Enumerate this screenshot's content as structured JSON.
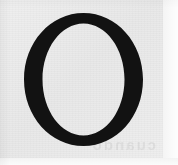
{
  "image": {
    "kind": "scanned-page-fragment",
    "width": 178,
    "height": 165,
    "description": "Scanned fragment of a printed page showing a single large capital letter"
  },
  "paper": {
    "name": "scanned-paper-sheet",
    "background_color": "#ececec",
    "margin_color": "#fafafa",
    "left": 0,
    "top": 0,
    "width": 163,
    "height": 158
  },
  "letter": {
    "character": "O",
    "case": "uppercase",
    "style": "didone-serif",
    "ink_color": "#121212",
    "stroke_contrast": "high",
    "thick_stroke_px": 18,
    "thin_stroke_px": 10,
    "bounds": {
      "x": 24,
      "y": 13,
      "width": 119,
      "height": 133
    },
    "counter_color": "#ececec"
  },
  "ghost": {
    "name": "bleed-through-text",
    "text": "cuando",
    "legible": false,
    "opacity": 0.055
  }
}
